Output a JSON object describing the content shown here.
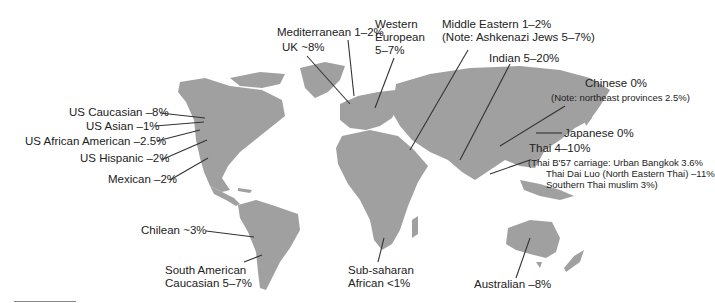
{
  "map": {
    "land_color": "#a0a0a0",
    "leader_color": "#333333",
    "background": "#ffffff"
  },
  "labels": {
    "mediterranean": "Mediterranean 1–2%",
    "uk": "UK ~8%",
    "western_line1": "Western",
    "western_line2": "European",
    "western_line3": "5–7%",
    "middle_eastern_line1": "Middle Eastern 1–2%",
    "middle_eastern_line2": "(Note: Ashkenazi Jews 5–7%)",
    "indian": "Indian 5–20%",
    "chinese_line1": "Chinese 0%",
    "chinese_line2": "(Note: northeast provinces 2.5%)",
    "japanese": "Japanese 0%",
    "thai_line1": "Thai 4–10%",
    "thai_line2": "(Thai B'57 carriage: Urban Bangkok 3.6%",
    "thai_line3": "Thai Dai Luo (North Eastern Thai) –11%",
    "thai_line4": "Southern Thai muslim 3%)",
    "us_caucasian": "US Caucasian –8%",
    "us_asian": "US Asian –1%",
    "us_african_american": "US African American –2.5%",
    "us_hispanic": "US Hispanic –2%",
    "mexican": "Mexican –2%",
    "chilean": "Chilean ~3%",
    "south_american_line1": "South American",
    "south_american_line2": "Caucasian 5–7%",
    "subsaharan_line1": "Sub-saharan",
    "subsaharan_line2": "African <1%",
    "australian": "Australian –8%"
  }
}
